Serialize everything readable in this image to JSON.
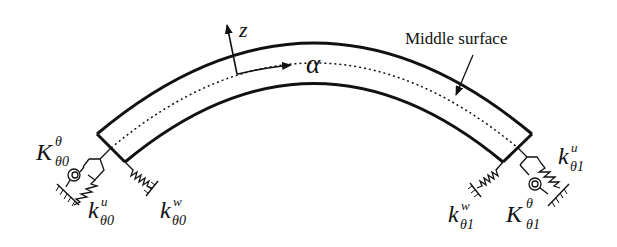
{
  "diagram": {
    "axes": {
      "normal_axis_label": "z",
      "tangent_axis_label": "α"
    },
    "annotation": {
      "middle_surface_label": "Middle surface"
    },
    "left_end": {
      "rotational_spring": {
        "symbol": "K",
        "superscript": "θ",
        "subscript": "θ0"
      },
      "tangential_spring": {
        "symbol": "k",
        "superscript": "u",
        "subscript": "θ0"
      },
      "normal_spring": {
        "symbol": "k",
        "superscript": "w",
        "subscript": "θ0"
      }
    },
    "right_end": {
      "rotational_spring": {
        "symbol": "K",
        "superscript": "θ",
        "subscript": "θ1"
      },
      "tangential_spring": {
        "symbol": "k",
        "superscript": "u",
        "subscript": "θ1"
      },
      "normal_spring": {
        "symbol": "k",
        "superscript": "w",
        "subscript": "θ1"
      }
    },
    "colors": {
      "line": "#111111",
      "background": "#ffffff"
    }
  }
}
